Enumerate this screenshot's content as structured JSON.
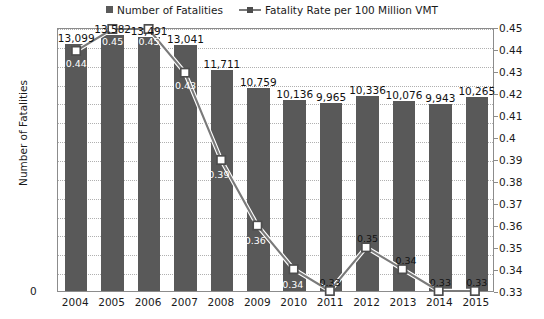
{
  "legend": {
    "items": [
      {
        "label": "Number of Fatalities",
        "marker": "square-swatch",
        "color": "#595959"
      },
      {
        "label": "Fatality Rate per 100 Million VMT",
        "marker": "line-square-marker",
        "color": "#7a7a7a"
      }
    ]
  },
  "axes": {
    "y_left_title": "Number of Fatalities",
    "y_right_title": "Fatality Rate per 100 Million Vehicle Miles Traveled (VMT)",
    "y_left_ticks": [
      "0",
      "1,000",
      "2,000",
      "3,000",
      "4,000",
      "5,000",
      "6,000",
      "7,000",
      "8,000",
      "9,000",
      "10,000",
      "11,000",
      "12,000",
      "13,000",
      "14,000"
    ],
    "y_right_ticks": [
      "0.33",
      "0.34",
      "0.35",
      "0.36",
      "0.37",
      "0.38",
      "0.39",
      "0.4",
      "0.41",
      "0.42",
      "0.43",
      "0.44",
      "0.45"
    ],
    "x_ticks": [
      "2004",
      "2005",
      "2006",
      "2007",
      "2008",
      "2009",
      "2010",
      "2011",
      "2012",
      "2013",
      "2014",
      "2015"
    ]
  },
  "chart_data": {
    "type": "bar",
    "title": "",
    "xlabel": "",
    "ylabel": "Number of Fatalities",
    "y2label": "Fatality Rate per 100 Million Vehicle Miles Traveled (VMT)",
    "categories": [
      "2004",
      "2005",
      "2006",
      "2007",
      "2008",
      "2009",
      "2010",
      "2011",
      "2012",
      "2013",
      "2014",
      "2015"
    ],
    "ylim": [
      0,
      14000
    ],
    "y2lim": [
      0.33,
      0.45
    ],
    "grid": true,
    "legend_position": "top",
    "series": [
      {
        "name": "Number of Fatalities",
        "type": "bar",
        "axis": "left",
        "color": "#595959",
        "values": [
          13099,
          13582,
          13491,
          13041,
          11711,
          10759,
          10136,
          9965,
          10336,
          10076,
          9943,
          10265
        ],
        "labels": [
          "13,099",
          "13,582",
          "13,491",
          "13,041",
          "11,711",
          "10,759",
          "10,136",
          "9,965",
          "10,336",
          "10,076",
          "9,943",
          "10,265"
        ]
      },
      {
        "name": "Fatality Rate per 100 Million VMT",
        "type": "line",
        "axis": "right",
        "color": "#7a7a7a",
        "values": [
          0.44,
          0.45,
          0.45,
          0.43,
          0.39,
          0.36,
          0.34,
          0.33,
          0.35,
          0.34,
          0.33,
          0.33
        ],
        "labels": [
          "0.44",
          "0.45",
          "0.45",
          "0.43",
          "0.39",
          "0.36",
          "0.34",
          "0.33",
          "0.35",
          "0.34",
          "0.33",
          "0.33"
        ]
      }
    ]
  },
  "colors": {
    "bar": "#595959",
    "line": "#7a7a7a",
    "marker_fill": "#ffffff",
    "marker_stroke": "#4d4d4d",
    "grid": "#b0b0b0",
    "axis": "#8c8c8c",
    "text": "#1a1a1a"
  }
}
